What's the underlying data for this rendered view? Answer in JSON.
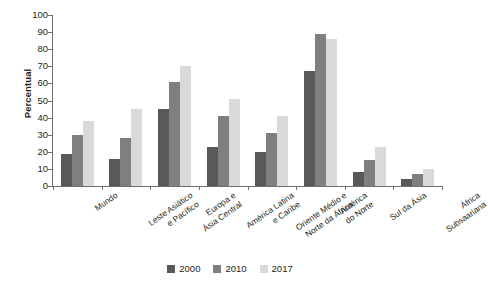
{
  "chart_data": {
    "type": "bar",
    "title": "",
    "xlabel": "",
    "ylabel": "Percentual",
    "ylim": [
      0,
      100
    ],
    "ytick_step": 10,
    "yticks": [
      100,
      90,
      80,
      70,
      60,
      50,
      40,
      30,
      20,
      10,
      0
    ],
    "grid": false,
    "legend_position": "bottom-center",
    "categories": [
      "Mundo",
      "Leste Asiático\ne Pacífico",
      "Europa e\nÁsia Central",
      "América Latina\ne Caribe",
      "Oriente Médio e\nNorte da África",
      "América\ndo Norte",
      "Sul da Ásia",
      "África\nSubsaariana"
    ],
    "series": [
      {
        "name": "2000",
        "color": "#595959",
        "values": [
          19,
          16,
          45,
          23,
          20,
          67,
          8,
          4
        ]
      },
      {
        "name": "2010",
        "color": "#7f7f7f",
        "values": [
          30,
          28,
          61,
          41,
          31,
          89,
          15,
          7
        ]
      },
      {
        "name": "2017",
        "color": "#d9d9d9",
        "values": [
          38,
          45,
          70,
          51,
          41,
          86,
          23,
          10
        ]
      }
    ]
  },
  "axis": {
    "ylabel": "Percentual"
  },
  "legend": {
    "items": [
      {
        "label": "2000",
        "color": "#595959"
      },
      {
        "label": "2010",
        "color": "#7f7f7f"
      },
      {
        "label": "2017",
        "color": "#d9d9d9"
      }
    ]
  },
  "colors": {
    "axis": "#6d6e71",
    "text": "#231f20",
    "background": "#ffffff"
  }
}
